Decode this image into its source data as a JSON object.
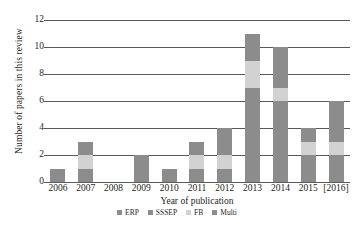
{
  "chart_data": {
    "type": "bar",
    "subtype": "stacked-vertical",
    "title": "",
    "xlabel": "Year of publication",
    "ylabel": "Number of papers in this review",
    "categories": [
      "2006",
      "2007",
      "2008",
      "2009",
      "2010",
      "2011",
      "2012",
      "2013",
      "2014",
      "2015",
      "[2016]"
    ],
    "ylim": [
      0,
      12
    ],
    "yticks": [
      0,
      2,
      4,
      6,
      8,
      10,
      12
    ],
    "ytick_labels": [
      "0",
      "2",
      "4",
      "6",
      "8",
      "10",
      "12"
    ],
    "grid": "horizontal",
    "legend_position": "bottom",
    "series": [
      {
        "name": "ERP",
        "color": "#8c8c8c",
        "values": [
          1,
          1,
          0,
          2,
          1,
          1,
          1,
          7,
          6,
          2,
          2
        ]
      },
      {
        "name": "SSSEP",
        "color": "#9a9a9a",
        "values": [
          0,
          0,
          0,
          0,
          0,
          0,
          0,
          0,
          0,
          0,
          0
        ]
      },
      {
        "name": "FB",
        "color": "#d2d2d2",
        "values": [
          0,
          1,
          0,
          0,
          0,
          1,
          1,
          2,
          1,
          1,
          1
        ]
      },
      {
        "name": "Multi",
        "color": "#8c8c8c",
        "values": [
          0,
          1,
          0,
          0,
          0,
          1,
          2,
          2,
          3,
          1,
          3
        ]
      }
    ],
    "totals": [
      1,
      2,
      0,
      2,
      1,
      3,
      4,
      11,
      10,
      4,
      6
    ]
  },
  "legend": {
    "items": [
      {
        "label": "ERP",
        "color": "#8c8c8c"
      },
      {
        "label": "SSSEP",
        "color": "#8c8c8c"
      },
      {
        "label": "FB",
        "color": "#d2d2d2"
      },
      {
        "label": "Multi",
        "color": "#8c8c8c"
      }
    ]
  },
  "colors": {
    "axis": "#5a5a5a",
    "text": "#231f20",
    "background": "#ffffff"
  }
}
